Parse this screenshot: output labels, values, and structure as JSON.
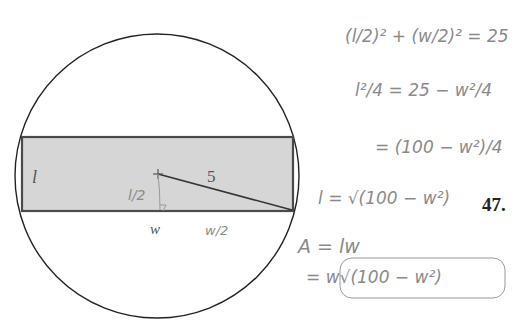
{
  "figure": {
    "problem_number": "47.",
    "colors": {
      "circle_stroke": "#222222",
      "rect_fill": "#d6d6d6",
      "rect_stroke": "#4a4a4a",
      "handwriting": "#8a8a8a"
    },
    "diagram_labels": {
      "left_side": "l",
      "radius": "5",
      "half_length": "l/2",
      "width": "w",
      "half_width": "w/2"
    },
    "work": [
      {
        "id": "eq1",
        "text": "(l/2)² + (w/2)² = 25"
      },
      {
        "id": "eq2",
        "text": "l²/4 = 25 − w²/4"
      },
      {
        "id": "eq3",
        "text": "= (100 − w²)/4"
      },
      {
        "id": "eq4",
        "text": "l = √(100 − w²)"
      },
      {
        "id": "eq5",
        "text": "A = lw"
      },
      {
        "id": "eq6",
        "text": "= w√(100 − w²)"
      }
    ]
  }
}
